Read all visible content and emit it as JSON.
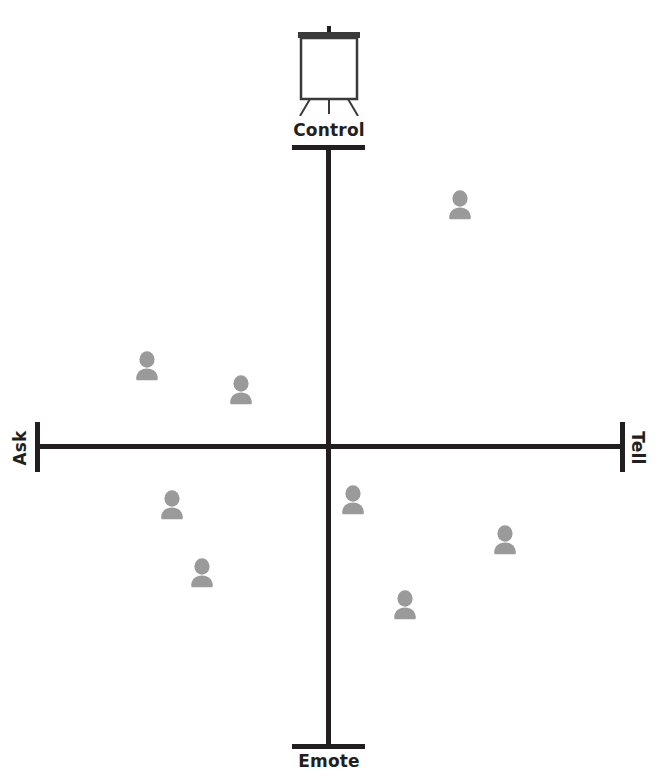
{
  "diagram": {
    "type": "quadrant-scatter",
    "background_color": "#ffffff",
    "axis_color": "#231f20",
    "person_color": "#9a9a9a"
  },
  "axes": {
    "horizontal": {
      "left_label": "Ask",
      "right_label": "Tell",
      "left_label_rotation": "-90deg",
      "right_label_rotation": "90deg"
    },
    "vertical": {
      "top_label": "Control",
      "bottom_label": "Emote"
    }
  },
  "icons": {
    "flipchart": "flipchart-easel-icon",
    "person": "person-bust-icon"
  },
  "chart_data": {
    "type": "scatter",
    "xlabel": "Ask ↔ Tell",
    "ylabel": "Emote ↔ Control",
    "xlim": [
      -1,
      1
    ],
    "ylim": [
      -1,
      1
    ],
    "grid": false,
    "legend": null,
    "origin_px": [
      329,
      447
    ],
    "marker": "person-bust-icon",
    "marker_color": "#9a9a9a",
    "quadrant_labels": [
      "Control",
      "Tell",
      "Emote",
      "Ask"
    ],
    "points": [
      {
        "id": "p1",
        "quadrant": "control-tell",
        "x": 0.45,
        "y": 0.84,
        "px": [
          460,
          205
        ]
      },
      {
        "id": "p2",
        "quadrant": "control-ask",
        "x": -0.63,
        "y": 0.31,
        "px": [
          147,
          366
        ]
      },
      {
        "id": "p3",
        "quadrant": "control-ask",
        "x": -0.31,
        "y": 0.21,
        "px": [
          241,
          390
        ]
      },
      {
        "id": "p4",
        "quadrant": "emote-ask",
        "x": -0.55,
        "y": -0.17,
        "px": [
          172,
          505
        ]
      },
      {
        "id": "p5",
        "quadrant": "emote-ask",
        "x": -0.45,
        "y": -0.41,
        "px": [
          202,
          573
        ]
      },
      {
        "id": "p6",
        "quadrant": "emote-tell",
        "x": 0.08,
        "y": -0.17,
        "px": [
          353,
          500
        ]
      },
      {
        "id": "p7",
        "quadrant": "emote-tell",
        "x": 0.58,
        "y": -0.31,
        "px": [
          505,
          540
        ]
      },
      {
        "id": "p8",
        "quadrant": "emote-tell",
        "x": 0.26,
        "y": -0.52,
        "px": [
          405,
          605
        ]
      }
    ]
  }
}
